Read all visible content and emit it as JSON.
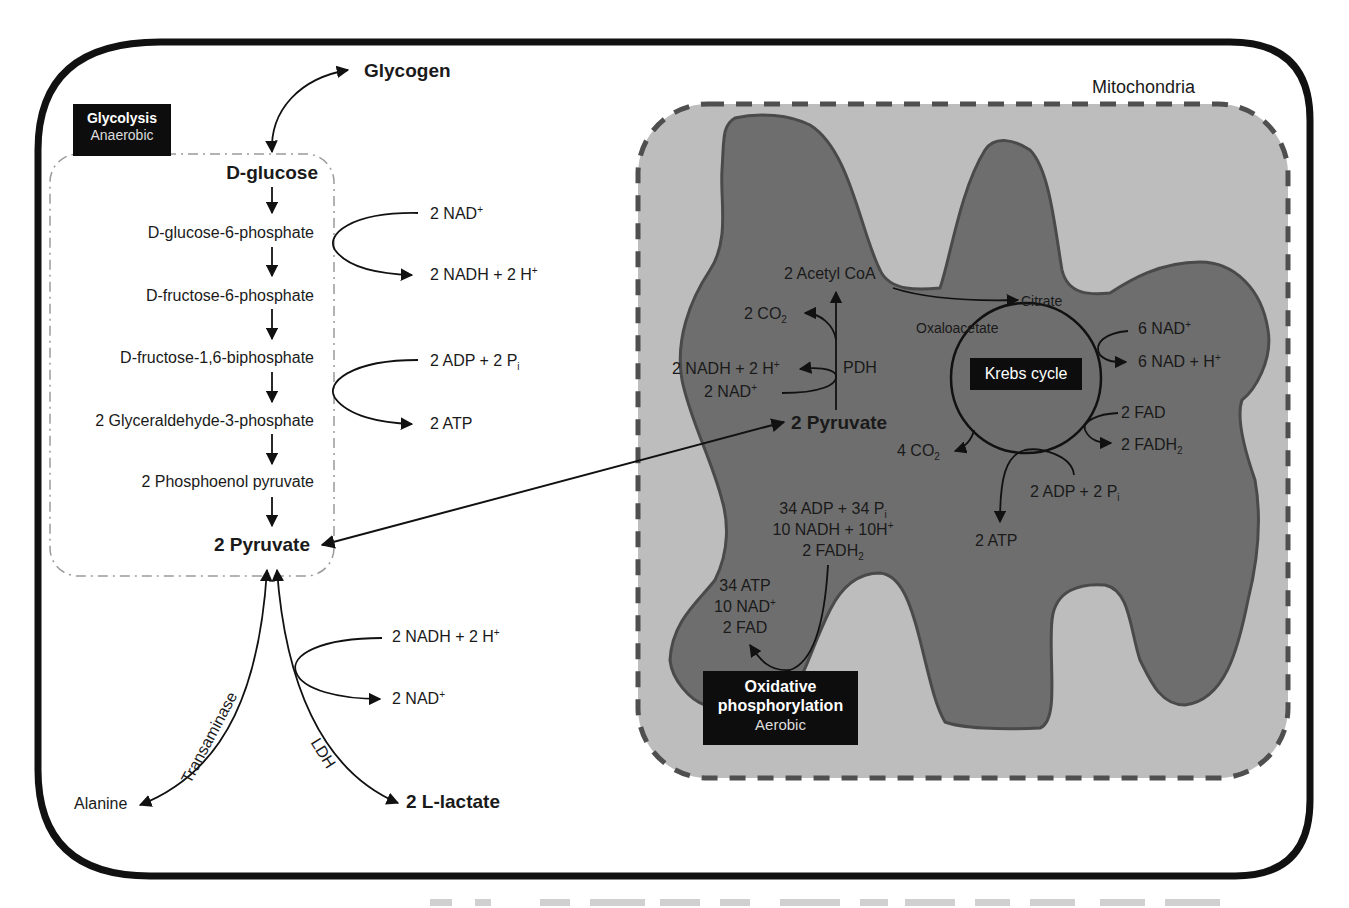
{
  "diagram": {
    "compartments": {
      "cell": "cell-membrane",
      "mitochondria_label": "Mitochondria"
    },
    "glycolysis": {
      "title": "Glycolysis",
      "subtitle": "Anaerobic",
      "start": "D-glucose",
      "storage": "Glycogen",
      "steps": [
        "D-glucose-6-phosphate",
        "D-fructose-6-phosphate",
        "D-fructose-1,6-biphosphate",
        "2 Glyceraldehyde-3-phosphate",
        "2 Phosphoenol pyruvate"
      ],
      "end": "2 Pyruvate",
      "cofactors": {
        "nad_in": "2 NAD",
        "nad_in_sup": "+",
        "nadh_out": "2 NADH + 2 H",
        "nadh_out_sup": "+",
        "adp_in": "2 ADP + 2 P",
        "adp_in_sub": "i",
        "atp_out": "2 ATP"
      }
    },
    "fates": {
      "transaminase": "Transaminase",
      "alanine": "Alanine",
      "ldh": "LDH",
      "lactate": "2 L-lactate",
      "nadh_in": "2 NADH + 2 H",
      "nadh_in_sup": "+",
      "nad_out": "2 NAD",
      "nad_out_sup": "+"
    },
    "mitochondria": {
      "pyruvate": "2 Pyruvate",
      "pdh": "PDH",
      "acetyl_coa": "2 Acetyl CoA",
      "co2_pdh": "2 CO",
      "co2_pdh_sub": "2",
      "nadh_pdh": "2 NADH + 2 H",
      "nadh_pdh_sup": "+",
      "nad_pdh": "2 NAD",
      "nad_pdh_sup": "+",
      "krebs": {
        "label": "Krebs cycle",
        "citrate": "Citrate",
        "oxaloacetate": "Oxaloacetate",
        "nad_in": "6 NAD",
        "nad_in_sup": "+",
        "nad_out": "6 NAD + H",
        "nad_out_sup": "+",
        "fad_in": "2 FAD",
        "fadh_out": "2 FADH",
        "fadh_out_sub": "2",
        "co2_out": "4 CO",
        "co2_out_sub": "2",
        "adp_in": "2 ADP + 2 P",
        "adp_in_sub": "i",
        "atp_out": "2 ATP"
      },
      "oxphos": {
        "title_line1": "Oxidative",
        "title_line2": "phosphorylation",
        "subtitle": "Aerobic",
        "inputs": {
          "line1": "34 ADP + 34 P",
          "line1_sub": "i",
          "line2": "10 NADH + 10H",
          "line2_sup": "+",
          "line3": "2 FADH",
          "line3_sub": "2"
        },
        "outputs": {
          "line1": "34 ATP",
          "line2": "10 NAD",
          "line2_sup": "+",
          "line3": "2 FAD"
        }
      }
    },
    "colors": {
      "outline": "#111111",
      "mito_outer": "#bdbdbd",
      "mito_inner": "#6e6e6e",
      "mito_inner_stroke": "#4a4a4a",
      "mito_dash": "#4f4f4f",
      "glyco_dash": "#9a9a9a",
      "label_box": "#0d0d0d"
    }
  }
}
